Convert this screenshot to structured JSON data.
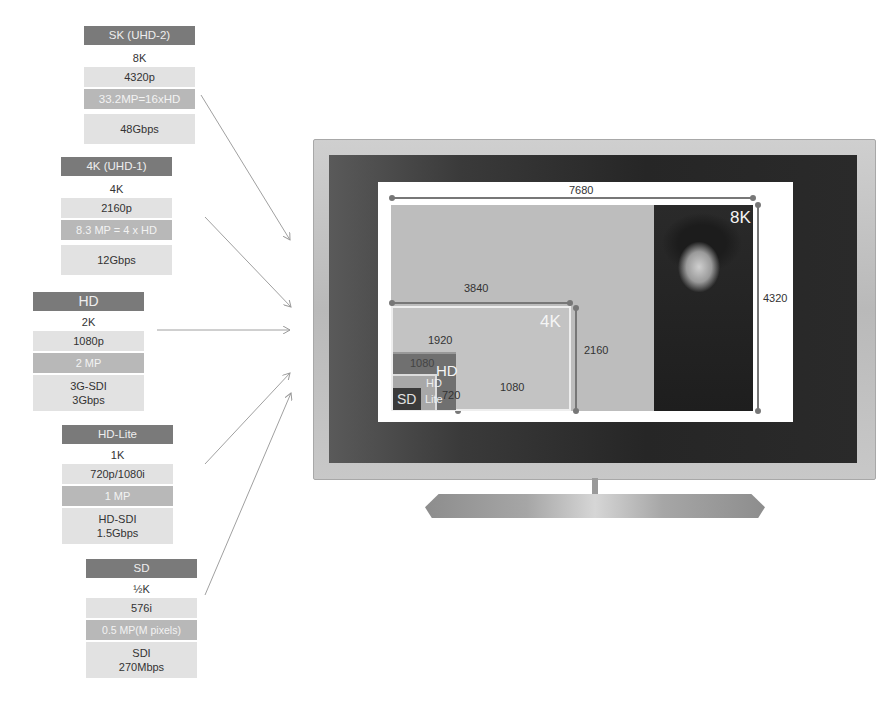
{
  "specs": [
    {
      "id": "8k",
      "title": "SK (UHD-2)",
      "name": "8K",
      "lines": "4320p",
      "megapixels": "33.2MP=16xHD",
      "bandwidth": [
        "48Gbps"
      ]
    },
    {
      "id": "4k",
      "title": "4K (UHD-1)",
      "name": "4K",
      "lines": "2160p",
      "megapixels": "8.3 MP = 4 x HD",
      "bandwidth": [
        "12Gbps"
      ]
    },
    {
      "id": "hd",
      "title": "HD",
      "name": "2K",
      "lines": "1080p",
      "megapixels": "2 MP",
      "bandwidth": [
        "3G-SDI",
        "3Gbps"
      ]
    },
    {
      "id": "hdlite",
      "title": "HD-Lite",
      "name": "1K",
      "lines": "720p/1080i",
      "megapixels": "1 MP",
      "bandwidth": [
        "HD-SDI",
        "1.5Gbps"
      ]
    },
    {
      "id": "sd",
      "title": "SD",
      "name": "½K",
      "lines": "576i",
      "megapixels": "0.5 MP(M pixels)",
      "bandwidth": [
        "SDI",
        "270Mbps"
      ]
    }
  ],
  "screen": {
    "width_8k": "7680",
    "height_8k": "4320",
    "width_4k": "3840",
    "height_4k": "2160",
    "width_hd": "1920",
    "height_hd": "1080",
    "width_hdlite_label": "1080",
    "height_hdlite": "720",
    "label_8k": "8K",
    "label_4k": "4K",
    "label_hd": "HD",
    "label_hdlite_1": "HD",
    "label_hdlite_2": "Lite",
    "label_sd": "SD"
  },
  "colors": {
    "title_bar": "#7a7a7a",
    "light_row": "#e2e2e2",
    "mid_row": "#b8b8b8",
    "screen_gray": "#bdbdbd",
    "hd_box": "#6e6e6e",
    "sd_box": "#3a3a3a",
    "bezel": "#2a2a2a"
  }
}
